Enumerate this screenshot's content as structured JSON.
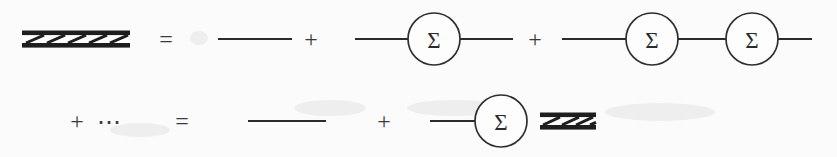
{
  "figure": {
    "kind": "feynman-diagram",
    "name": "dyson-equation",
    "width": 837,
    "height": 157,
    "background_color": "#fbfbfb",
    "ink_color": "#2c2c2c",
    "hatch_color": "#1e1e1e"
  },
  "symbols": {
    "equals": "=",
    "plus": "+",
    "ellipsis": "⋯",
    "sigma": "Σ"
  },
  "rows": [
    {
      "id": "row-1",
      "y": 39,
      "terms": [
        {
          "type": "dressed-propagator",
          "label": "dressed-propagator",
          "x": 22,
          "width": 108,
          "slashes": 5
        },
        {
          "type": "operator",
          "label": "=",
          "x": 166
        },
        {
          "type": "bare-propagator",
          "label": "bare-propagator",
          "x1": 218,
          "x2": 292
        },
        {
          "type": "operator",
          "label": "+",
          "x": 311
        },
        {
          "type": "self-energy-chain",
          "label": "self-energy-single",
          "circles": 1,
          "x1": 355,
          "x2": 513,
          "centers": [
            434
          ]
        },
        {
          "type": "operator",
          "label": "+",
          "x": 535
        },
        {
          "type": "self-energy-chain",
          "label": "self-energy-double",
          "circles": 2,
          "x1": 562,
          "x2": 812,
          "centers": [
            652,
            752
          ]
        }
      ]
    },
    {
      "id": "row-2",
      "y": 121,
      "terms": [
        {
          "type": "operator",
          "label": "+",
          "x": 77
        },
        {
          "type": "operator",
          "label": "⋯",
          "x": 108
        },
        {
          "type": "operator",
          "label": "=",
          "x": 182
        },
        {
          "type": "bare-propagator",
          "label": "bare-propagator",
          "x1": 248,
          "x2": 326
        },
        {
          "type": "operator",
          "label": "+",
          "x": 384
        },
        {
          "type": "self-energy-dressed",
          "label": "self-energy-then-dressed",
          "x1": 430,
          "circle_cx": 501,
          "hatch_x": 540,
          "hatch_w": 56,
          "slashes": 4
        }
      ]
    }
  ],
  "geometry": {
    "circle_radius": 26,
    "line_width": 2.1,
    "hatch_bar_thickness": 4.5,
    "hatch_total_height": 17,
    "sigma_font_size": 23,
    "operator_font_size": 24
  }
}
